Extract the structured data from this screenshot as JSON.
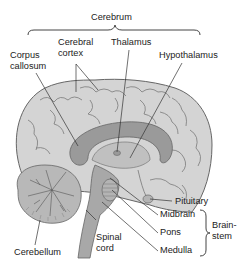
{
  "diagram": {
    "type": "anatomical-illustration",
    "colors": {
      "background": "#ffffff",
      "cerebrum_fill": "#d4d4d4",
      "dark_structures": "#9a9a9a",
      "outline": "#666666",
      "leader_line": "#333333",
      "text": "#222222"
    },
    "group_labels": {
      "cerebrum": "Cerebrum",
      "brainstem_line1": "Brain-",
      "brainstem_line2": "stem"
    },
    "labels": {
      "corpus_callosum_1": "Corpus",
      "corpus_callosum_2": "callosum",
      "cerebral_cortex_1": "Cerebral",
      "cerebral_cortex_2": "cortex",
      "thalamus": "Thalamus",
      "hypothalamus": "Hypothalamus",
      "pituitary": "Pituitary",
      "midbrain": "Midbrain",
      "pons": "Pons",
      "medulla": "Medulla",
      "spinal_cord_1": "Spinal",
      "spinal_cord_2": "cord",
      "cerebellum": "Cerebellum"
    }
  }
}
